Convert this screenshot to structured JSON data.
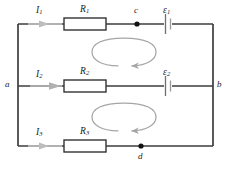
{
  "figure": {
    "name": "three-branch-circuit-with-two-emf-sources",
    "background_color": "#ffffff",
    "wire_color": "#3d3d3d",
    "arrow_color": "#b3b3b3",
    "loop_arrow_color": "#a6a6a6",
    "resistor_fill": "#ffffff",
    "resistor_stroke": "#333333",
    "node_dot_color": "#111111",
    "text_color": "#1b1b1b"
  },
  "labels": {
    "current_1": {
      "symbol": "I",
      "subscript": "1",
      "x": 36,
      "y": 6
    },
    "current_2": {
      "symbol": "I",
      "subscript": "2",
      "x": 36,
      "y": 70
    },
    "current_3": {
      "symbol": "I",
      "subscript": "3",
      "x": 36,
      "y": 128
    },
    "resistor_1": {
      "symbol": "R",
      "subscript": "1",
      "x": 84,
      "y": 6
    },
    "resistor_2": {
      "symbol": "R",
      "subscript": "2",
      "x": 84,
      "y": 70
    },
    "resistor_3": {
      "symbol": "R",
      "subscript": "3",
      "x": 84,
      "y": 128
    },
    "emf_1": {
      "symbol": "ε",
      "subscript": "1",
      "x": 163,
      "y": 6
    },
    "emf_2": {
      "symbol": "ε",
      "subscript": "2",
      "x": 163,
      "y": 70
    },
    "node_a": {
      "symbol": "a",
      "x": 5,
      "y": 80
    },
    "node_b": {
      "symbol": "b",
      "x": 217,
      "y": 80
    },
    "node_c": {
      "symbol": "c",
      "x": 134,
      "y": 6
    },
    "node_d": {
      "symbol": "d",
      "x": 138,
      "y": 152
    }
  },
  "components": {
    "resistors": [
      {
        "name": "R1",
        "x": 64,
        "y": 18,
        "width": 42,
        "height": 12
      },
      {
        "name": "R2",
        "x": 64,
        "y": 80,
        "width": 42,
        "height": 12
      },
      {
        "name": "R3",
        "x": 64,
        "y": 140,
        "width": 42,
        "height": 12
      }
    ],
    "emf_sources": [
      {
        "name": "emf-1",
        "x": 168,
        "y": 24
      },
      {
        "name": "emf-2",
        "x": 168,
        "y": 86
      }
    ],
    "current_arrows": [
      {
        "name": "current-arrow-1",
        "x": 44,
        "y": 24,
        "direction": "right"
      },
      {
        "name": "current-arrow-2",
        "x": 54,
        "y": 86,
        "direction": "right"
      },
      {
        "name": "current-arrow-3",
        "x": 44,
        "y": 146,
        "direction": "right"
      }
    ],
    "junction_dots": [
      {
        "name": "junction-c",
        "x": 137,
        "y": 24
      },
      {
        "name": "junction-d",
        "x": 141,
        "y": 146
      }
    ],
    "loop_arrows": [
      {
        "name": "loop-arrow-upper",
        "cx": 124,
        "cy": 52,
        "rx": 32,
        "ry": 14,
        "direction": "counterclockwise"
      },
      {
        "name": "loop-arrow-lower",
        "cx": 124,
        "cy": 117,
        "rx": 32,
        "ry": 14,
        "direction": "counterclockwise"
      }
    ],
    "wires": {
      "left_rail_x": 18,
      "right_rail_x": 213,
      "top_y": 24,
      "middle_y": 86,
      "bottom_y": 146
    }
  }
}
